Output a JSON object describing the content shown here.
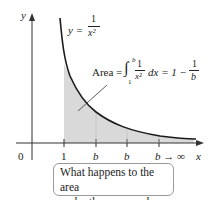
{
  "figure": {
    "axes": {
      "x_label": "x",
      "y_label": "y",
      "origin_label": "0"
    },
    "ticks": [
      "1",
      "b",
      "b",
      "b → ∞"
    ],
    "curve_label": {
      "lhs": "y =",
      "num": "1",
      "den": "x²"
    },
    "area_label": {
      "prefix": "Area =",
      "upper": "b",
      "lower": "1",
      "integrand_num": "1",
      "integrand_den": "x²",
      "dx": "dx = 1 −",
      "rhs_num": "1",
      "rhs_den": "b"
    },
    "callout": {
      "line1": "What happens to the area",
      "line2": "under the curve as b → ∞ ?"
    },
    "colors": {
      "shade": "#d9d9d9",
      "curve": "#1a1a1a",
      "axis": "#333333"
    }
  }
}
